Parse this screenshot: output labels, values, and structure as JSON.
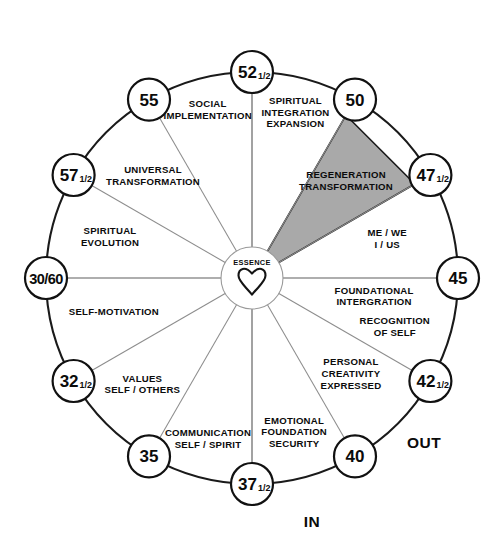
{
  "diagram": {
    "hub": {
      "label": "ESSENCE",
      "icon": "heart-icon"
    },
    "axis_labels": {
      "in": "IN",
      "out": "OUT"
    },
    "geometry": {
      "center_x": 252,
      "center_y": 278,
      "radius": 206,
      "node_radius": 21,
      "hub_radius": 31,
      "node_count": 12,
      "degrees_per_node": 30
    },
    "colors": {
      "highlight_fill": "#a9a9a9",
      "ring_stroke": "#1a1a1a",
      "spoke_stroke": "#8d8d8d",
      "background": "#ffffff",
      "text": "#0b0b0b"
    },
    "nodes": [
      {
        "id": "n45",
        "whole": "45",
        "fraction": "",
        "angle_deg": 0,
        "wide": false
      },
      {
        "id": "n42h",
        "whole": "42",
        "fraction": "1/2",
        "angle_deg": -30,
        "wide": false
      },
      {
        "id": "n40",
        "whole": "40",
        "fraction": "",
        "angle_deg": -60,
        "wide": false
      },
      {
        "id": "n37h",
        "whole": "37",
        "fraction": "1/2",
        "angle_deg": -90,
        "wide": false
      },
      {
        "id": "n35",
        "whole": "35",
        "fraction": "",
        "angle_deg": -120,
        "wide": false
      },
      {
        "id": "n32h",
        "whole": "32",
        "fraction": "1/2",
        "angle_deg": -150,
        "wide": false
      },
      {
        "id": "n3060",
        "whole": "30/60",
        "fraction": "",
        "angle_deg": 180,
        "wide": true
      },
      {
        "id": "n57h",
        "whole": "57",
        "fraction": "1/2",
        "angle_deg": 150,
        "wide": false
      },
      {
        "id": "n55",
        "whole": "55",
        "fraction": "",
        "angle_deg": 120,
        "wide": false
      },
      {
        "id": "n52h",
        "whole": "52",
        "fraction": "1/2",
        "angle_deg": 90,
        "wide": false
      },
      {
        "id": "n50",
        "whole": "50",
        "fraction": "",
        "angle_deg": 60,
        "wide": false
      },
      {
        "id": "n47h",
        "whole": "47",
        "fraction": "1/2",
        "angle_deg": 30,
        "wide": false
      }
    ],
    "sectors": [
      {
        "id": "s-regeneration",
        "lines": [
          "REGENERATION",
          "TRANSFORMATION"
        ],
        "mid_angle_deg": 45,
        "from_node": "n50",
        "to_node": "n47h",
        "highlighted": true,
        "label_radius": 133
      },
      {
        "id": "s-spiritual-integration",
        "lines": [
          "SPIRITUAL",
          "INTEGRATION",
          "EXPANSION"
        ],
        "mid_angle_deg": 75,
        "from_node": "n52h",
        "to_node": "n50",
        "highlighted": false,
        "label_radius": 168
      },
      {
        "id": "s-social-implementation",
        "lines": [
          "SOCIAL",
          "IMPLEMENTATION"
        ],
        "mid_angle_deg": 105,
        "from_node": "n55",
        "to_node": "n52h",
        "highlighted": false,
        "label_radius": 171
      },
      {
        "id": "s-universal-transformation",
        "lines": [
          "UNIVERSAL",
          "TRANSFORMATION"
        ],
        "mid_angle_deg": 135,
        "from_node": "n57h",
        "to_node": "n55",
        "highlighted": false,
        "label_radius": 140
      },
      {
        "id": "s-spiritual-evolution",
        "lines": [
          "SPIRITUAL",
          "EVOLUTION"
        ],
        "mid_angle_deg": 165,
        "from_node": "n3060",
        "to_node": "n57h",
        "highlighted": false,
        "label_radius": 147
      },
      {
        "id": "s-self-motivation",
        "lines": [
          "SELF-MOTIVATION"
        ],
        "mid_angle_deg": -165,
        "from_node": "n32h",
        "to_node": "n3060",
        "highlighted": false,
        "label_radius": 143
      },
      {
        "id": "s-values",
        "lines": [
          "VALUES",
          "SELF / OTHERS"
        ],
        "mid_angle_deg": -135,
        "from_node": "n35",
        "to_node": "n32h",
        "highlighted": false,
        "label_radius": 155
      },
      {
        "id": "s-communication",
        "lines": [
          "COMMUNICATION",
          "SELF / SPIRIT"
        ],
        "mid_angle_deg": -105,
        "from_node": "n37h",
        "to_node": "n35",
        "highlighted": false,
        "label_radius": 170
      },
      {
        "id": "s-emotional-foundation",
        "lines": [
          "EMOTIONAL",
          "FOUNDATION",
          "SECURITY"
        ],
        "mid_angle_deg": -75,
        "from_node": "n40",
        "to_node": "n37h",
        "highlighted": false,
        "label_radius": 163
      },
      {
        "id": "s-personal-creativity",
        "lines": [
          "PERSONAL",
          "CREATIVITY",
          "EXPRESSED"
        ],
        "mid_angle_deg": -45,
        "from_node": "n42h",
        "to_node": "n40",
        "highlighted": false,
        "label_radius": 140
      },
      {
        "id": "s-recognition-of-self",
        "lines": [
          "RECOGNITION",
          "OF SELF"
        ],
        "mid_angle_deg": -20,
        "from_node": "n45",
        "to_node": "n42h",
        "highlighted": false,
        "label_radius": 152
      },
      {
        "id": "s-foundational-integration",
        "lines": [
          "FOUNDATIONAL",
          "INTERGRATION"
        ],
        "mid_angle_deg": -10,
        "from_node": "n45",
        "to_node": "n42h",
        "highlighted": false,
        "label_radius": 124
      },
      {
        "id": "s-me-we",
        "lines": [
          "ME / WE",
          "I / US"
        ],
        "mid_angle_deg": 15,
        "from_node": "n47h",
        "to_node": "n45",
        "highlighted": false,
        "label_radius": 140
      }
    ]
  }
}
